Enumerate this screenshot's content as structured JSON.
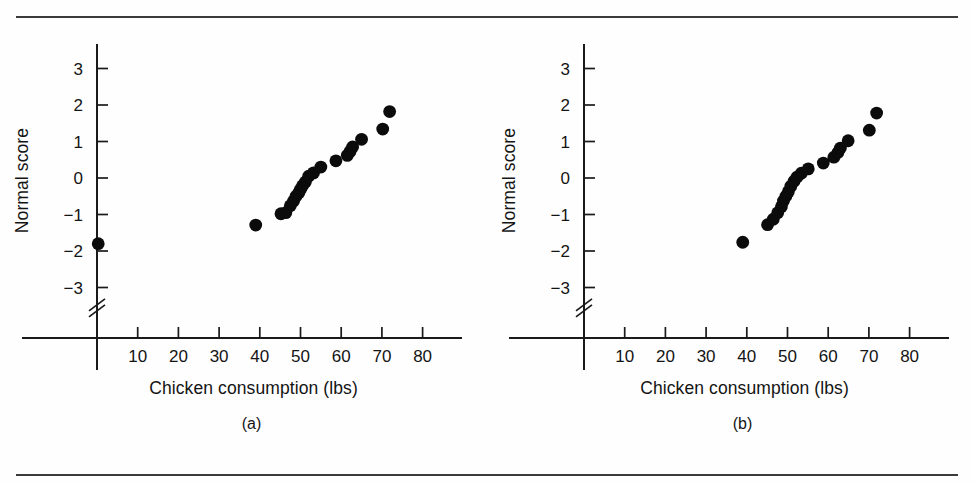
{
  "figure": {
    "panels": [
      {
        "id": "a",
        "caption": "(a)",
        "xlabel": "Chicken consumption (lbs)",
        "ylabel": "Normal score"
      },
      {
        "id": "b",
        "caption": "(b)",
        "xlabel": "Chicken consumption (lbs)",
        "ylabel": "Normal score"
      }
    ],
    "rule_color": "#3a3a3a",
    "marker_color": "#0b0b0b",
    "axis_color": "#1a1a1a"
  },
  "chart_data": [
    {
      "type": "scatter",
      "id": "a",
      "title": "",
      "xlabel": "Chicken consumption (lbs)",
      "ylabel": "Normal score",
      "xlim": [
        0,
        85
      ],
      "ylim": [
        -3.6,
        3.6
      ],
      "xticks": [
        10,
        20,
        30,
        40,
        50,
        60,
        70,
        80
      ],
      "xticklabels": [
        "10",
        "20",
        "30",
        "40",
        "50",
        "60",
        "70",
        "80"
      ],
      "yticks": [
        -3,
        -2,
        -1,
        0,
        1,
        2,
        3
      ],
      "yticklabels": [
        "−3",
        "−2",
        "−1",
        "0",
        "1",
        "2",
        "3"
      ],
      "grid": false,
      "legend": null,
      "y_axis_break": true,
      "y_axis_break_position": -3.45,
      "annotations": [
        "(a)"
      ],
      "points": [
        {
          "x": 0.3,
          "y": -1.8
        },
        {
          "x": 39.0,
          "y": -1.29
        },
        {
          "x": 45.2,
          "y": -0.98
        },
        {
          "x": 46.4,
          "y": -0.95
        },
        {
          "x": 47.5,
          "y": -0.76
        },
        {
          "x": 48.3,
          "y": -0.63
        },
        {
          "x": 48.9,
          "y": -0.5
        },
        {
          "x": 49.6,
          "y": -0.4
        },
        {
          "x": 50.0,
          "y": -0.31
        },
        {
          "x": 50.5,
          "y": -0.21
        },
        {
          "x": 51.2,
          "y": -0.11
        },
        {
          "x": 52.0,
          "y": 0.05
        },
        {
          "x": 53.2,
          "y": 0.14
        },
        {
          "x": 55.0,
          "y": 0.3
        },
        {
          "x": 58.7,
          "y": 0.47
        },
        {
          "x": 61.5,
          "y": 0.62
        },
        {
          "x": 62.2,
          "y": 0.73
        },
        {
          "x": 62.8,
          "y": 0.85
        },
        {
          "x": 65.0,
          "y": 1.06
        },
        {
          "x": 70.2,
          "y": 1.34
        },
        {
          "x": 71.9,
          "y": 1.82
        }
      ]
    },
    {
      "type": "scatter",
      "id": "b",
      "title": "",
      "xlabel": "Chicken consumption (lbs)",
      "ylabel": "Normal score",
      "xlim": [
        0,
        85
      ],
      "ylim": [
        -3.6,
        3.6
      ],
      "xticks": [
        10,
        20,
        30,
        40,
        50,
        60,
        70,
        80
      ],
      "xticklabels": [
        "10",
        "20",
        "30",
        "40",
        "50",
        "60",
        "70",
        "80"
      ],
      "yticks": [
        -3,
        -2,
        -1,
        0,
        1,
        2,
        3
      ],
      "yticklabels": [
        "−3",
        "−2",
        "−1",
        "0",
        "1",
        "2",
        "3"
      ],
      "grid": false,
      "legend": null,
      "y_axis_break": true,
      "y_axis_break_position": -3.45,
      "annotations": [
        "(b)"
      ],
      "points": [
        {
          "x": 39.0,
          "y": -1.76
        },
        {
          "x": 45.1,
          "y": -1.28
        },
        {
          "x": 46.5,
          "y": -1.13
        },
        {
          "x": 47.6,
          "y": -0.95
        },
        {
          "x": 48.5,
          "y": -0.79
        },
        {
          "x": 49.0,
          "y": -0.63
        },
        {
          "x": 49.6,
          "y": -0.5
        },
        {
          "x": 50.2,
          "y": -0.38
        },
        {
          "x": 50.8,
          "y": -0.23
        },
        {
          "x": 51.6,
          "y": -0.09
        },
        {
          "x": 52.3,
          "y": 0.02
        },
        {
          "x": 53.4,
          "y": 0.13
        },
        {
          "x": 55.1,
          "y": 0.25
        },
        {
          "x": 58.8,
          "y": 0.41
        },
        {
          "x": 61.4,
          "y": 0.57
        },
        {
          "x": 62.4,
          "y": 0.7
        },
        {
          "x": 63.0,
          "y": 0.82
        },
        {
          "x": 64.9,
          "y": 1.02
        },
        {
          "x": 70.1,
          "y": 1.31
        },
        {
          "x": 71.9,
          "y": 1.78
        }
      ]
    }
  ]
}
